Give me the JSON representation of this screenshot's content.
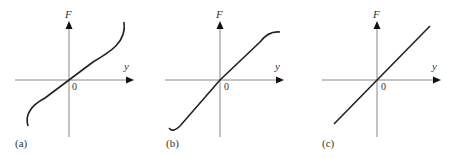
{
  "figure": {
    "panels": [
      {
        "id": "a",
        "label": "(a)",
        "y_axis_label": "F",
        "x_axis_label": "y",
        "origin_label": "0",
        "curve": "cubic-stiffening (S-shaped, steepening at ends)"
      },
      {
        "id": "b",
        "label": "(b)",
        "y_axis_label": "F",
        "x_axis_label": "y",
        "origin_label": "0",
        "curve": "softening (flattening at ends)"
      },
      {
        "id": "c",
        "label": "(c)",
        "y_axis_label": "F",
        "x_axis_label": "y",
        "origin_label": "0",
        "curve": "linear"
      }
    ],
    "colors": {
      "axis": "#888888",
      "curve": "#222222"
    }
  }
}
